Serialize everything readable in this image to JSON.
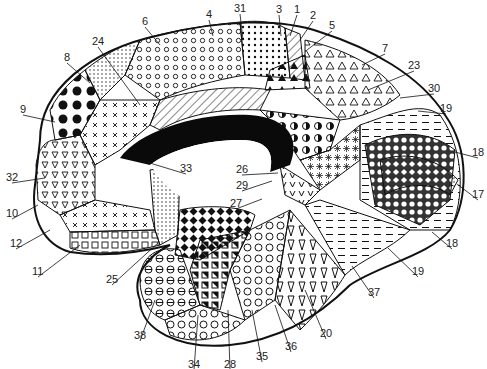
{
  "diagram": {
    "colors": {
      "ink": "#111111",
      "background": "#ffffff",
      "corpus_callosum": "#0a0a0a"
    },
    "labels": [
      {
        "id": "31",
        "text": "31",
        "x": 234,
        "y": 3,
        "tx": 243,
        "ty": 40
      },
      {
        "id": "4",
        "text": "4",
        "x": 206,
        "y": 9,
        "tx": 213,
        "ty": 36
      },
      {
        "id": "3",
        "text": "3",
        "x": 276,
        "y": 4,
        "tx": 281,
        "ty": 36
      },
      {
        "id": "1",
        "text": "1",
        "x": 294,
        "y": 4,
        "tx": 290,
        "ty": 36
      },
      {
        "id": "2",
        "text": "2",
        "x": 310,
        "y": 10,
        "tx": 300,
        "ty": 40
      },
      {
        "id": "5",
        "text": "5",
        "x": 329,
        "y": 20,
        "tx": 307,
        "ty": 50
      },
      {
        "id": "6",
        "text": "6",
        "x": 142,
        "y": 16,
        "tx": 160,
        "ty": 45
      },
      {
        "id": "24",
        "text": "24",
        "x": 92,
        "y": 36,
        "tx": 140,
        "ty": 105
      },
      {
        "id": "8",
        "text": "8",
        "x": 64,
        "y": 52,
        "tx": 90,
        "ty": 83
      },
      {
        "id": "7",
        "text": "7",
        "x:": 0,
        "x": 382,
        "y": 43,
        "tx": 362,
        "ty": 65
      },
      {
        "id": "23",
        "text": "23",
        "x": 408,
        "y": 60,
        "tx": 368,
        "ty": 90
      },
      {
        "id": "30",
        "text": "30",
        "x": 428,
        "y": 83,
        "tx": 400,
        "ty": 98
      },
      {
        "id": "19",
        "text": "19",
        "x": 440,
        "y": 103,
        "tx": 418,
        "ty": 111
      },
      {
        "id": "9",
        "text": "9",
        "x": 20,
        "y": 104,
        "tx": 55,
        "ty": 122
      },
      {
        "id": "18",
        "text": "18",
        "x": 472,
        "y": 147,
        "tx": 455,
        "ty": 152
      },
      {
        "id": "17",
        "text": "17",
        "x": 472,
        "y": 189,
        "tx": 457,
        "ty": 184
      },
      {
        "id": "33",
        "text": "33",
        "x": 180,
        "y": 163,
        "tx": 140,
        "ty": 160
      },
      {
        "id": "26",
        "text": "26",
        "x": 236,
        "y": 164,
        "tx": 278,
        "ty": 173
      },
      {
        "id": "29",
        "text": "29",
        "x": 236,
        "y": 180,
        "tx": 272,
        "ty": 181
      },
      {
        "id": "27",
        "text": "27",
        "x": 230,
        "y": 198,
        "tx": 262,
        "ty": 199
      },
      {
        "id": "32",
        "text": "32",
        "x": 6,
        "y": 172,
        "tx": 45,
        "ty": 178
      },
      {
        "id": "10",
        "text": "10",
        "x": 6,
        "y": 208,
        "tx": 38,
        "ty": 205
      },
      {
        "id": "12",
        "text": "12",
        "x": 10,
        "y": 238,
        "tx": 50,
        "ty": 230
      },
      {
        "id": "11",
        "text": "11",
        "x": 32,
        "y": 266,
        "tx": 80,
        "ty": 245
      },
      {
        "id": "25",
        "text": "25",
        "x": 106,
        "y": 274,
        "tx": 158,
        "ty": 243
      },
      {
        "id": "18b",
        "text": "18",
        "x": 446,
        "y": 238,
        "tx": 432,
        "ty": 232
      },
      {
        "id": "19b",
        "text": "19",
        "x": 412,
        "y": 266,
        "tx": 388,
        "ty": 248
      },
      {
        "id": "37",
        "text": "37",
        "x": 368,
        "y": 287,
        "tx": 352,
        "ty": 266
      },
      {
        "id": "20",
        "text": "20",
        "x": 320,
        "y": 328,
        "tx": 305,
        "ty": 290
      },
      {
        "id": "36",
        "text": "36",
        "x": 285,
        "y": 341,
        "tx": 275,
        "ty": 305
      },
      {
        "id": "35",
        "text": "35",
        "x": 256,
        "y": 351,
        "tx": 252,
        "ty": 310
      },
      {
        "id": "38",
        "text": "38",
        "x": 134,
        "y": 330,
        "tx": 155,
        "ty": 300
      },
      {
        "id": "34",
        "text": "34",
        "x": 188,
        "y": 359,
        "tx": 198,
        "ty": 315
      },
      {
        "id": "28",
        "text": "28",
        "x": 224,
        "y": 359,
        "tx": 228,
        "ty": 310
      }
    ]
  }
}
